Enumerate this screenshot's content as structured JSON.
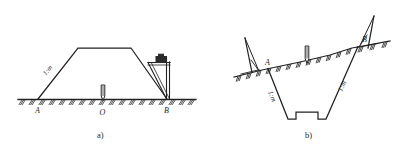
{
  "figure": {
    "title_a": "a)",
    "title_b": "b)",
    "panel_a": {
      "caption": "a)",
      "point_left_label": "A",
      "point_center_label": "O",
      "point_right_label": "B",
      "slope_ratio_label": "1:m",
      "description_name": "embankment-cross-section"
    },
    "panel_b": {
      "caption": "b)",
      "point_left_label": "A",
      "point_right_label": "B",
      "slope_ratio_left_label": "1:m",
      "slope_ratio_right_label": "1:m",
      "description_name": "cutting-cross-section"
    },
    "icons": {
      "ground_hatch": "ground-hatch-icon",
      "stake": "stake-icon",
      "slope_template": "slope-template-icon",
      "level_vial": "level-vial-icon",
      "ranging_pole": "ranging-pole-icon"
    },
    "colors": {
      "ink": "#222222",
      "paper": "#ffffff",
      "hatch": "#2b2b2b"
    }
  }
}
